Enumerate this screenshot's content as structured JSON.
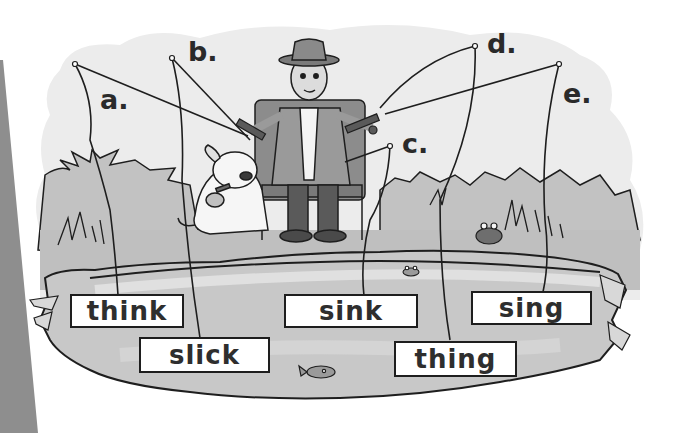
{
  "labels": {
    "a": "a.",
    "b": "b.",
    "c": "c.",
    "d": "d.",
    "e": "e."
  },
  "words": {
    "think": "think",
    "slick": "slick",
    "sink": "sink",
    "thing": "thing",
    "sing": "sing"
  },
  "colors": {
    "background": "#ffffff",
    "sky_wash": "#ececec",
    "grass": "#b9b9b9",
    "pond": "#c6c6c6",
    "pond_light": "#dadada",
    "ink": "#1e1e1e",
    "page_edge": "#8c8c8c"
  }
}
